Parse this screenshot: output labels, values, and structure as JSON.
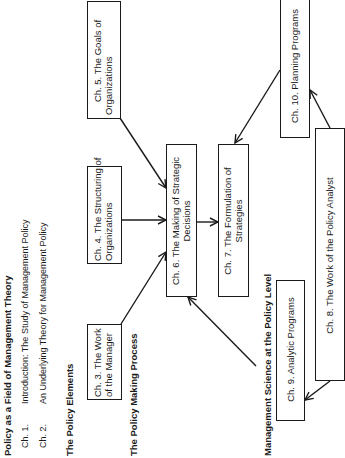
{
  "sections": {
    "part1": {
      "heading": "Policy as a Field of Management Theory",
      "chapters": [
        {
          "num": "Ch. 1.",
          "title": "Introduction: The Study of Management Policy"
        },
        {
          "num": "Ch. 2.",
          "title": "An Underlying Theory for Management Policy"
        }
      ]
    },
    "part2": {
      "heading": "The Policy Elements"
    },
    "part3": {
      "heading": "The Policy Making Process"
    },
    "part4": {
      "heading": "Management Science at the Policy Level"
    }
  },
  "boxes": {
    "ch3": {
      "line1": "Ch. 3. The Work",
      "line2": "of the Manager"
    },
    "ch4": {
      "line1": "Ch. 4. The Structuring of",
      "line2": "Organizations"
    },
    "ch5": {
      "line1": "Ch. 5. The Goals of",
      "line2": "Organizations"
    },
    "ch6": {
      "line1": "Ch. 6. The Making of Strategic",
      "line2": "Decisions"
    },
    "ch7": {
      "line1": "Ch. 7. The Formulation of",
      "line2": "Strategies"
    },
    "ch8": {
      "line1": "Ch. 8. The Work of the Policy Analyst",
      "line2": ""
    },
    "ch9": {
      "line1": "Ch. 9. Analytic Programs",
      "line2": ""
    },
    "ch10": {
      "line1": "Ch. 10. Planning Programs",
      "line2": ""
    }
  },
  "connections": [
    {
      "from": "ch3",
      "to": "ch6"
    },
    {
      "from": "ch4",
      "to": "ch6"
    },
    {
      "from": "ch5",
      "to": "ch6"
    },
    {
      "from": "ch6",
      "to": "ch7"
    },
    {
      "from": "ch10",
      "to": "ch7"
    },
    {
      "from": "ch8",
      "to": "ch10"
    },
    {
      "from": "ch8",
      "to": "ch9"
    },
    {
      "from": "ch9",
      "to": "ch6"
    }
  ]
}
